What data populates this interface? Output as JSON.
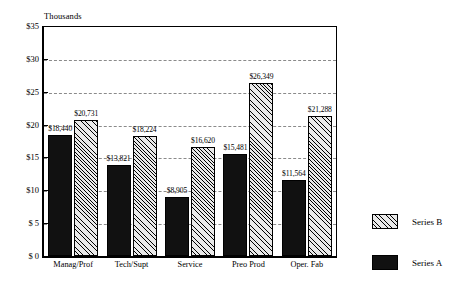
{
  "chart_data": {
    "type": "bar",
    "title": "",
    "subtitle": "",
    "axis_note": "Thousands",
    "xlabel": "",
    "ylabel": "",
    "categories": [
      "Manag/Prof",
      "Tech/Supt",
      "Service",
      "Preo Prod",
      "Oper. Fab"
    ],
    "series": [
      {
        "name": "Series A",
        "values": [
          18440,
          13821,
          8905,
          15481,
          11564
        ],
        "data_labels": [
          "$18,440",
          "$13,821",
          "$8,905",
          "$15,481",
          "$11,564"
        ],
        "color": "#111111",
        "fill": "solid-black"
      },
      {
        "name": "Series B",
        "values": [
          20731,
          18224,
          16620,
          26349,
          21288
        ],
        "data_labels": [
          "$20,731",
          "$18,224",
          "$16,620",
          "$26,349",
          "$21,288"
        ],
        "color": "#e9e9e9",
        "fill": "diagonal-hatch"
      }
    ],
    "ylim": [
      0,
      35000
    ],
    "ytick_values": [
      0,
      5000,
      10000,
      15000,
      20000,
      25000,
      30000,
      35000
    ],
    "ytick_labels": [
      "$ 0",
      "$ 5",
      "$10",
      "$15",
      "$20",
      "$25",
      "$30",
      "$35"
    ],
    "grid": true,
    "grid_axis": "y",
    "legend_position": "right",
    "legend_entries": [
      "Series B",
      "Series A"
    ]
  }
}
